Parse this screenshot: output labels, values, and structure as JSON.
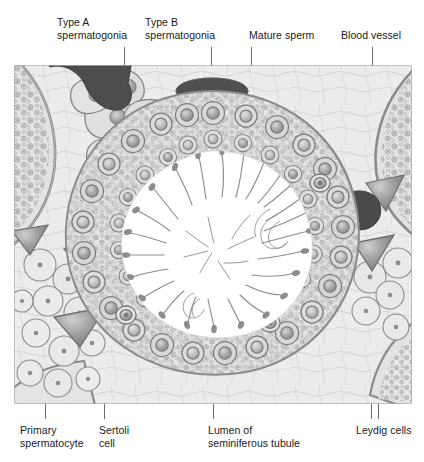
{
  "figure": {
    "kind": "anatomical-illustration",
    "style": "grayscale histology drawing",
    "frame": {
      "x": 14,
      "y": 65,
      "width": 398,
      "height": 339
    }
  },
  "palette": {
    "background": "#ffffff",
    "label_text": "#1a1a1a",
    "leader_line": "#6e6e6e",
    "frame_stroke": "#8b8b8b",
    "outline_dark": "#5a5a5a",
    "outline_mid": "#7d7d7d",
    "tissue_light": "#e8e8e8",
    "tissue_mid": "#cfcfcf",
    "tissue_dark": "#a8a8a8",
    "blood_vessel_dark": "#4a4a4a",
    "lumen_white": "#ffffff",
    "sperm_gray": "#8a8a8a",
    "basement_membrane": "#9a9a9a"
  },
  "labels": {
    "top": [
      {
        "id": "type-a-spermatogonia",
        "text": "Type A\nspermatogonia",
        "text_x": 57,
        "text_y": 16,
        "leader_x": 124,
        "leader_y1": 47,
        "leader_y2": 131
      },
      {
        "id": "type-b-spermatogonia",
        "text": "Type B\nspermatogonia",
        "text_x": 145,
        "text_y": 16,
        "leader_x": 211,
        "leader_y1": 47,
        "leader_y2": 104
      },
      {
        "id": "mature-sperm",
        "text": "Mature sperm",
        "text_x": 249,
        "text_y": 29,
        "leader_x": 251,
        "leader_y1": 47,
        "leader_y2": 82
      },
      {
        "id": "blood-vessel",
        "text": "Blood vessel",
        "text_x": 341,
        "text_y": 29,
        "leader_x": 372,
        "leader_y1": 47,
        "leader_y2": 118
      }
    ],
    "bottom": [
      {
        "id": "primary-spermatocyte",
        "text": "Primary\nspermatocyte",
        "text_x": 20,
        "text_y": 424,
        "leader_x": 45,
        "leader_y1": 341,
        "leader_y2": 419
      },
      {
        "id": "sertoli-cell",
        "text": "Sertoli\ncell",
        "text_x": 99,
        "text_y": 424,
        "leader_x": 104,
        "leader_y1": 356,
        "leader_y2": 419
      },
      {
        "id": "lumen-of-seminiferous-tubule",
        "text": "Lumen of\nseminiferous tubule",
        "text_x": 208,
        "text_y": 424,
        "leader_x": 213,
        "leader_y1": 248,
        "leader_y2": 419
      },
      {
        "id": "leydig-cells",
        "text": "Leydig cells",
        "text_x": 356,
        "text_y": 424,
        "leader_x": 371,
        "leader_y1": 310,
        "leader_y2": 419
      },
      {
        "id": "leydig-cells-second-leader",
        "text": "",
        "text_x": 0,
        "text_y": 0,
        "leader_x": 378,
        "leader_y1": 379,
        "leader_y2": 419
      }
    ]
  },
  "diagram_content": {
    "regions": [
      {
        "name": "lumen",
        "description": "Central white open space of the seminiferous tubule",
        "fill": "#ffffff"
      },
      {
        "name": "germinal-epithelium",
        "description": "Dense multilayered ring of spermatogenic cells lining the tubule",
        "fill": "#dcdcdc"
      },
      {
        "name": "interstitium",
        "description": "Loose connective tissue between tubules containing Leydig cells and blood vessels",
        "fill": "#eaeaea"
      },
      {
        "name": "basement-membrane",
        "description": "Thick gray boundary separating tubule from interstitium",
        "fill": "#9a9a9a"
      }
    ],
    "cell_types": [
      "Type A spermatogonia",
      "Type B spermatogonia",
      "Primary spermatocyte",
      "Sertoli cell",
      "Mature sperm",
      "Leydig cells"
    ],
    "structures": [
      "Blood vessel",
      "Lumen of seminiferous tubule",
      "Basement membrane"
    ]
  }
}
